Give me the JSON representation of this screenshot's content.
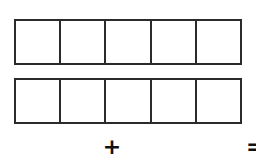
{
  "diagram": {
    "background_color": "#ffffff",
    "stroke_color": "#2b2b2b",
    "fill_color": "#ffffff",
    "bars": [
      {
        "name": "top-bar",
        "segments": 5,
        "filled_segments": 0,
        "cell_labels": [
          "",
          "",
          "",
          "",
          ""
        ],
        "label": ""
      },
      {
        "name": "bottom-bar",
        "segments": 5,
        "filled_segments": 0,
        "cell_labels": [
          "",
          "",
          "",
          "",
          ""
        ],
        "label": ""
      }
    ],
    "operators": [
      {
        "name": "plus",
        "symbol": "+"
      },
      {
        "name": "equals",
        "symbol": "="
      }
    ]
  }
}
